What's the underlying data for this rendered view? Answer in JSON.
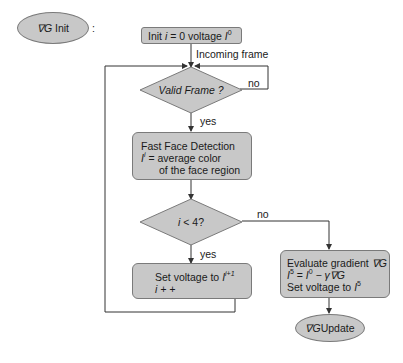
{
  "diagram": {
    "type": "flowchart",
    "colors": {
      "node_fill": "#c8c8c8",
      "node_border": "#7a7a7a",
      "line": "#333333"
    },
    "start_ellipse": {
      "label_symbol": "∇G",
      "label_text": "Init",
      "colon": ":"
    },
    "init_box": {
      "prefix": "Init ",
      "var": "i",
      "mid": " = 0 voltage ",
      "I": "I",
      "sup": "0"
    },
    "incoming_label": "Incoming frame",
    "valid_frame": {
      "label": "Valid Frame ?",
      "no": "no",
      "yes": "yes"
    },
    "face_detection": {
      "line1": "Fast Face Detection",
      "line2_var": "I",
      "line2_sup": "i",
      "line2_text": " = average color",
      "line3": "of the face region"
    },
    "loop_check": {
      "var": "i",
      "text": " < 4?",
      "no": "no",
      "yes": "yes"
    },
    "set_voltage": {
      "line1": "Set voltage to ",
      "I": "I",
      "sup": "i+1",
      "line2": "i + +"
    },
    "evaluate": {
      "line1_text": "Evaluate gradient ",
      "line1_symbol": "∇G",
      "line2_lhs": "I",
      "line2_lhs_sup": "5",
      "line2_mid": " = ",
      "line2_rhs": "I",
      "line2_rhs_sup": "0",
      "line2_tail": " − γ∇G",
      "line3_text": "Set voltage to ",
      "line3_I": "I",
      "line3_sup": "5"
    },
    "end_ellipse": {
      "label_symbol": "∇G",
      "label_text": " Update"
    }
  }
}
